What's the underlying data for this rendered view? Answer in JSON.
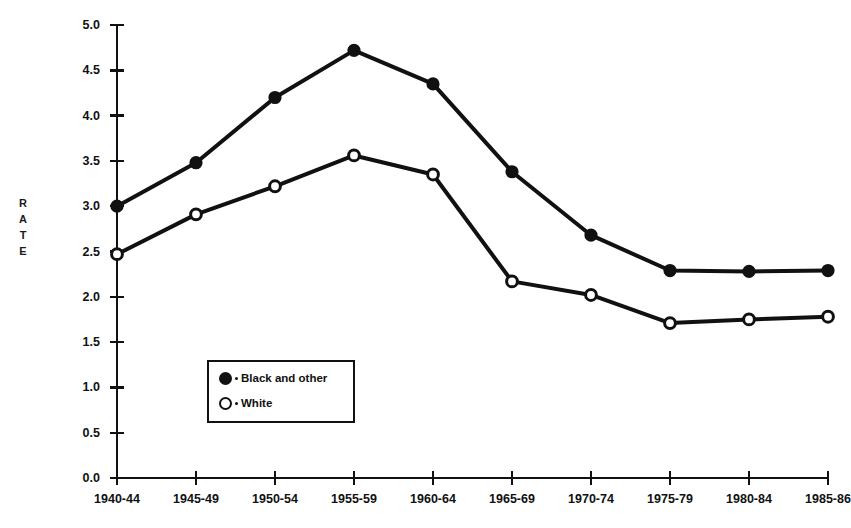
{
  "chart_data": {
    "type": "line",
    "title": "",
    "xlabel": "",
    "ylabel": "RATE",
    "ylabel_letters": [
      "R",
      "A",
      "T",
      "E"
    ],
    "categories": [
      "1940-44",
      "1945-49",
      "1950-54",
      "1955-59",
      "1960-64",
      "1965-69",
      "1970-74",
      "1975-79",
      "1980-84",
      "1985-86"
    ],
    "yticks": [
      "0.0",
      "0.5",
      "1.0",
      "1.5",
      "2.0",
      "2.5",
      "3.0",
      "3.5",
      "4.0",
      "4.5",
      "5.0"
    ],
    "ylim": [
      0.0,
      5.0
    ],
    "grid": false,
    "legend_position": "inside-lower-left",
    "series": [
      {
        "name": "Black and other",
        "marker": "filled-circle",
        "color": "#111111",
        "values": [
          3.0,
          3.48,
          4.2,
          4.72,
          4.35,
          3.38,
          2.68,
          2.29,
          2.28,
          2.29
        ]
      },
      {
        "name": "White",
        "marker": "open-circle",
        "color": "#111111",
        "values": [
          2.47,
          2.91,
          3.22,
          3.56,
          3.35,
          2.17,
          2.02,
          1.71,
          1.75,
          1.78
        ]
      }
    ]
  },
  "legend": {
    "items": [
      {
        "label": "Black and other",
        "marker": "filled-circle"
      },
      {
        "label": "White",
        "marker": "open-circle"
      }
    ]
  },
  "axes": {
    "y_title": "RATE",
    "y_tick_labels": [
      "5.0",
      "4.5",
      "4.0",
      "3.5",
      "3.0",
      "2.5",
      "2.0",
      "1.5",
      "1.0",
      "0.5",
      "0.0"
    ],
    "x_tick_labels": [
      "1940-44",
      "1945-49",
      "1950-54",
      "1955-59",
      "1960-64",
      "1965-69",
      "1970-74",
      "1975-79",
      "1980-84",
      "1985-86"
    ]
  },
  "colors": {
    "ink": "#111111",
    "background": "#ffffff"
  }
}
